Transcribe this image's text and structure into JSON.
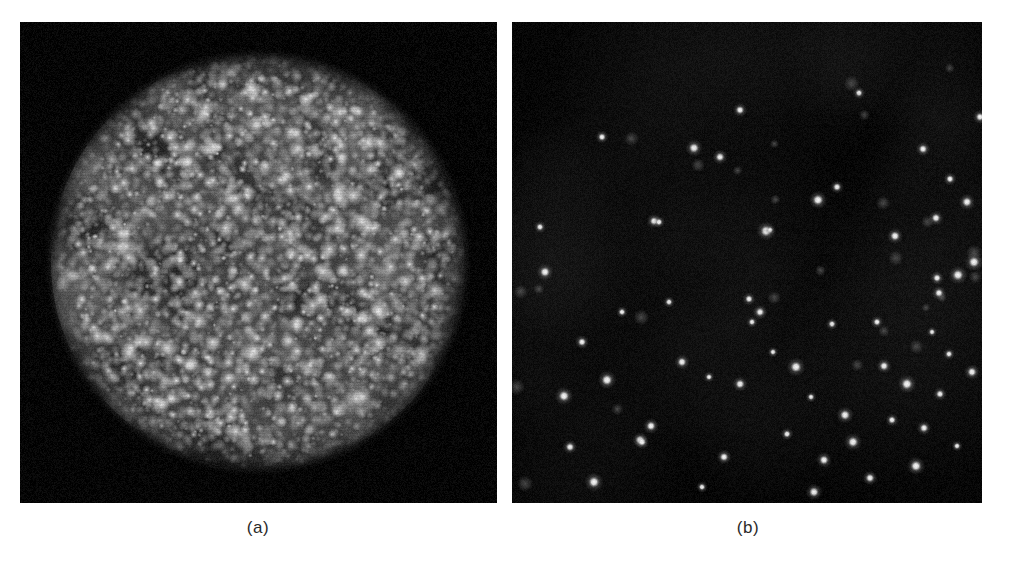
{
  "figure": {
    "background_color": "#ffffff",
    "width": 1010,
    "height": 566,
    "panels": [
      {
        "id": "a",
        "caption": "(a)",
        "caption_x": 258,
        "caption_y": 528,
        "x": 20,
        "y": 22,
        "width": 477,
        "height": 481,
        "background_color": "#050505",
        "content_type": "speckled-disc",
        "description": "Dense bright granular speckle pattern filling a circular disc on a black background",
        "disc": {
          "center_x": 238,
          "center_y": 240,
          "radius": 207,
          "edge_softness": 26,
          "core_gray": "#5a5a5a",
          "speckle_bright": "#e8e8e8",
          "speckle_count": 5200,
          "mottle_patch_count": 90
        }
      },
      {
        "id": "b",
        "caption": "(b)",
        "caption_x": 748,
        "caption_y": 528,
        "x": 512,
        "y": 22,
        "width": 470,
        "height": 481,
        "background_color": "#050505",
        "content_type": "sparse-point-sources",
        "description": "Sparse isolated bright point sources scattered on a near-black background",
        "spot_color": "#f2f2f2",
        "spot_count": 62
      }
    ]
  },
  "chart_data": {
    "type": "scatter",
    "title": "",
    "xlabel": "",
    "ylabel": "",
    "grid": false,
    "legend": null,
    "panels": [
      {
        "name": "(a)",
        "type": "heatmap",
        "description": "Circular field of dense unresolved bright speckles; intensity falls to background outside disc radius",
        "xlim": [
          0,
          477
        ],
        "ylim": [
          0,
          481
        ],
        "disc_center": [
          238,
          240
        ],
        "disc_radius": 207
      },
      {
        "name": "(b)",
        "type": "scatter",
        "description": "Isolated resolved point sources",
        "xlim": [
          0,
          470
        ],
        "ylim": [
          0,
          481
        ],
        "points": [
          [
            70,
            320
          ],
          [
            90,
            115
          ],
          [
            142,
            199
          ],
          [
            147,
            200
          ],
          [
            157,
            280
          ],
          [
            208,
            135
          ],
          [
            228,
            88
          ],
          [
            237,
            277
          ],
          [
            254,
            209
          ],
          [
            258,
            208
          ],
          [
            306,
            178
          ],
          [
            320,
            302
          ],
          [
            325,
            165
          ],
          [
            347,
            71
          ],
          [
            383,
            214
          ],
          [
            411,
            127
          ],
          [
            424,
            196
          ],
          [
            425,
            256
          ],
          [
            427,
            271
          ],
          [
            438,
            157
          ],
          [
            446,
            253
          ],
          [
            455,
            180
          ],
          [
            462,
            240
          ],
          [
            468,
            95
          ],
          [
            52,
            374
          ],
          [
            110,
            290
          ],
          [
            128,
            418
          ],
          [
            130,
            420
          ],
          [
            139,
            404
          ],
          [
            170,
            340
          ],
          [
            197,
            355
          ],
          [
            212,
            435
          ],
          [
            228,
            362
          ],
          [
            240,
            300
          ],
          [
            248,
            290
          ],
          [
            261,
            330
          ],
          [
            275,
            412
          ],
          [
            284,
            345
          ],
          [
            299,
            375
          ],
          [
            302,
            470
          ],
          [
            312,
            438
          ],
          [
            333,
            393
          ],
          [
            341,
            420
          ],
          [
            358,
            456
          ],
          [
            365,
            300
          ],
          [
            372,
            344
          ],
          [
            380,
            398
          ],
          [
            395,
            362
          ],
          [
            404,
            444
          ],
          [
            412,
            406
          ],
          [
            420,
            310
          ],
          [
            428,
            372
          ],
          [
            437,
            332
          ],
          [
            445,
            424
          ],
          [
            28,
            205
          ],
          [
            33,
            250
          ],
          [
            58,
            425
          ],
          [
            82,
            460
          ],
          [
            95,
            358
          ],
          [
            182,
            126
          ],
          [
            190,
            465
          ],
          [
            460,
            350
          ]
        ]
      }
    ]
  }
}
